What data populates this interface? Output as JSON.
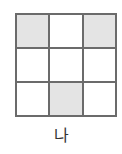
{
  "figure": {
    "label": "나",
    "grid": {
      "rows": 3,
      "cols": 3,
      "cells": [
        [
          true,
          false,
          true
        ],
        [
          false,
          false,
          false
        ],
        [
          false,
          true,
          false
        ]
      ]
    },
    "colors": {
      "border": "#6b6b6b",
      "shaded": "#e4e4e4",
      "empty": "#ffffff"
    }
  }
}
